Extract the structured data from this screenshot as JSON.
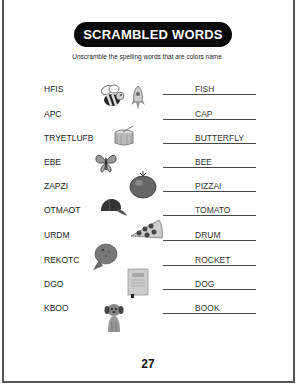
{
  "worksheet": {
    "title": "SCRAMBLED WORDS",
    "instructions": "Unscramble the spelling words that are colors name.",
    "page_number": "27",
    "rows": [
      {
        "scrambled": "HFIS",
        "answer": "FISH"
      },
      {
        "scrambled": "APC",
        "answer": "CAP"
      },
      {
        "scrambled": "TRYETLUFB",
        "answer": "BUTTERFLY"
      },
      {
        "scrambled": "EBE",
        "answer": "BEE"
      },
      {
        "scrambled": "ZAPZI",
        "answer": "PIZZAI"
      },
      {
        "scrambled": "OTMAOT",
        "answer": "TOMATO"
      },
      {
        "scrambled": "URDM",
        "answer": "DRUM"
      },
      {
        "scrambled": "REKOTC",
        "answer": "ROCKET"
      },
      {
        "scrambled": "DGO",
        "answer": "DOG"
      },
      {
        "scrambled": "KBOO",
        "answer": "BOOK"
      }
    ],
    "pictures": [
      "bee",
      "rocket",
      "drum",
      "butterfly",
      "tomato",
      "cap",
      "pizza",
      "fish",
      "book",
      "dog"
    ]
  }
}
